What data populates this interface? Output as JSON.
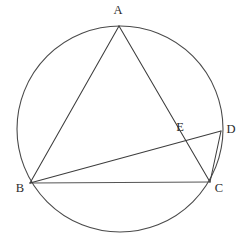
{
  "figure": {
    "background_color": "#ffffff",
    "stroke_color": "#3d3d3d",
    "circle_stroke_color": "#4a4a4a"
  },
  "labels": {
    "a": "A",
    "b": "B",
    "c": "C",
    "d": "D",
    "e": "E"
  },
  "chart_data": {
    "type": "diagram",
    "canvas": {
      "width": 252,
      "height": 247
    },
    "circle": {
      "cx": 120,
      "cy": 129,
      "r": 103
    },
    "points": [
      {
        "name": "A",
        "x": 119,
        "y": 26,
        "label_x": 118,
        "label_y": 11,
        "on_circle": true
      },
      {
        "name": "B",
        "x": 30,
        "y": 183,
        "label_x": 20,
        "label_y": 189,
        "on_circle": true
      },
      {
        "name": "C",
        "x": 210,
        "y": 182,
        "label_x": 219,
        "label_y": 189,
        "on_circle": true
      },
      {
        "name": "D",
        "x": 221,
        "y": 131,
        "label_x": 231,
        "label_y": 130,
        "on_circle": true
      },
      {
        "name": "E",
        "x": 184,
        "y": 138,
        "label_x": 180,
        "label_y": 128,
        "on_circle": false
      }
    ],
    "segments": [
      {
        "name": "AB",
        "from": "A",
        "to": "B"
      },
      {
        "name": "AC",
        "from": "A",
        "to": "C"
      },
      {
        "name": "BC",
        "from": "B",
        "to": "C"
      },
      {
        "name": "BD",
        "from": "B",
        "to": "D"
      },
      {
        "name": "DC",
        "from": "D",
        "to": "C"
      }
    ],
    "intersections": [
      {
        "point": "E",
        "of": [
          "AC",
          "BD"
        ]
      }
    ]
  }
}
